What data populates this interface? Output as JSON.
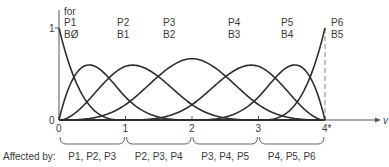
{
  "figure": {
    "title_partial": "",
    "y_axis": {
      "tick_labels": [
        "0",
        "1"
      ],
      "heading": "for"
    },
    "x_axis": {
      "label": "v",
      "tick_labels": [
        "0",
        "1",
        "2",
        "3",
        "4*"
      ]
    },
    "curve_labels": [
      {
        "point": "P1",
        "basis": "BØ"
      },
      {
        "point": "P2",
        "basis": "B1"
      },
      {
        "point": "P3",
        "basis": "B2"
      },
      {
        "point": "P4",
        "basis": "B3"
      },
      {
        "point": "P5",
        "basis": "B4"
      },
      {
        "point": "P6",
        "basis": "B5"
      }
    ],
    "affected_by": {
      "label": "Affected by:",
      "segments": [
        "P1, P2, P3",
        "P2, P3, P4",
        "P3, P4, P5",
        "P4, P5, P6"
      ]
    }
  },
  "chart_data": {
    "type": "line",
    "xlabel": "v",
    "ylabel": "",
    "xlim": [
      0,
      4
    ],
    "ylim": [
      0,
      1
    ],
    "knots": [
      0,
      0,
      0,
      0,
      1,
      2,
      3,
      4,
      4,
      4,
      4
    ],
    "degree": 3,
    "series": [
      {
        "name": "B0 (P1)",
        "peak": 1.0,
        "peak_at": 0
      },
      {
        "name": "B1 (P2)",
        "peak": 0.75,
        "peak_at": 0.9
      },
      {
        "name": "B2 (P3)",
        "peak": 0.67,
        "peak_at": 1.7
      },
      {
        "name": "B3 (P4)",
        "peak": 0.67,
        "peak_at": 2.3
      },
      {
        "name": "B4 (P5)",
        "peak": 0.75,
        "peak_at": 3.1
      },
      {
        "name": "B5 (P6)",
        "peak": 1.0,
        "peak_at": 4
      }
    ],
    "grid": false,
    "annotations": [
      "dashed vertical line at v=4",
      "Affected by: P1, P2, P3 | P2, P3, P4 | P3, P4, P5 | P4, P5, P6"
    ]
  }
}
